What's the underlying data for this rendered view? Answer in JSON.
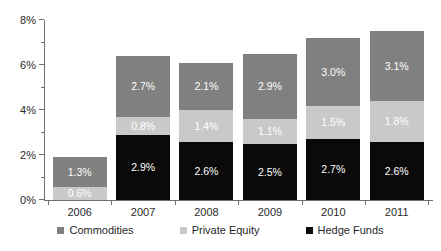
{
  "chart_data": {
    "type": "bar",
    "stacked": true,
    "title": "",
    "subtitle": "",
    "xlabel": "",
    "ylabel": "",
    "categories": [
      "2006",
      "2007",
      "2008",
      "2009",
      "2010",
      "2011"
    ],
    "series": [
      {
        "name": "Hedge Funds",
        "color": "#0a0a0a",
        "values": [
          null,
          2.9,
          2.6,
          2.5,
          2.7,
          2.6
        ],
        "labels": [
          "",
          "2.9%",
          "2.6%",
          "2.5%",
          "2.7%",
          "2.6%"
        ]
      },
      {
        "name": "Private Equity",
        "color": "#c9c9c9",
        "values": [
          0.6,
          0.8,
          1.4,
          1.1,
          1.5,
          1.8
        ],
        "labels": [
          "0.6%",
          "0.8%",
          "1.4%",
          "1.1%",
          "1.5%",
          "1.8%"
        ]
      },
      {
        "name": "Commodities",
        "color": "#808080",
        "values": [
          1.3,
          2.7,
          2.1,
          2.9,
          3.0,
          3.1
        ],
        "labels": [
          "1.3%",
          "2.7%",
          "2.1%",
          "2.9%",
          "3.0%",
          "3.1%"
        ]
      }
    ],
    "totals": [
      1.9,
      6.4,
      6.1,
      6.5,
      7.2,
      7.5
    ],
    "ylim": [
      0,
      8
    ],
    "ytick_labels": [
      "0%",
      "2%",
      "4%",
      "6%",
      "8%"
    ],
    "ytick_values": [
      0,
      2,
      4,
      6,
      8
    ],
    "yminor_values": [
      1,
      3,
      5,
      7
    ],
    "grid": false,
    "legend_position": "bottom"
  },
  "legend": {
    "items": [
      {
        "label": "Commodities",
        "swatch": "com"
      },
      {
        "label": "Private Equity",
        "swatch": "pe"
      },
      {
        "label": "Hedge Funds",
        "swatch": "hedge"
      }
    ]
  }
}
